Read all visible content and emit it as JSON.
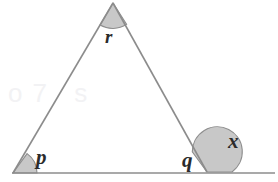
{
  "figure": {
    "background_color": "#ffffff",
    "stroke_color": "#8c8c8c",
    "arc_fill_color": "#c4c4c4",
    "arc_stroke_color": "#8a8a8a",
    "label_color": "#2b2b2b",
    "width": 278,
    "height": 182
  },
  "labels": {
    "apex_angle": "r",
    "bottom_left_angle": "p",
    "bottom_right_interior_angle": "q",
    "bottom_right_exterior_angle": "x"
  },
  "watermark": {
    "text": "o7 s"
  },
  "geometry": {
    "vertices": {
      "apex": {
        "x": 113,
        "y": 3
      },
      "bottom_left": {
        "x": 13,
        "y": 173
      },
      "bottom_right": {
        "x": 207,
        "y": 172
      }
    },
    "baseline": {
      "x_start": 12,
      "x_end": 275,
      "y": 173
    },
    "arcs": {
      "apex_radius": 22,
      "bottom_left_radius": 24,
      "bottom_right_exterior_radius": 25
    }
  }
}
